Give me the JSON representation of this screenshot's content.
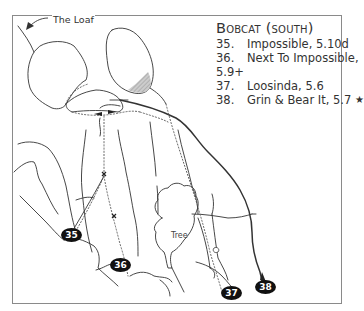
{
  "legend": {
    "title": "Bobcat (south)",
    "routes": [
      {
        "number": "35.",
        "name": "Impossible, 5.10d"
      },
      {
        "number": "36.",
        "name": "Next To Impossible,",
        "continuation": "5.9+"
      },
      {
        "number": "37.",
        "name": "Loosinda, 5.6"
      },
      {
        "number": "38.",
        "name": "Grin & Bear It, 5.7",
        "star": "★"
      }
    ]
  },
  "labels": {
    "loaf": "The Loaf",
    "tree": "Tree"
  },
  "badges": [
    "35",
    "36",
    "37",
    "38"
  ],
  "colors": {
    "line": "#333333",
    "frame": "#8a8a8a",
    "badge": "#111111",
    "shade": "#bbbbbb"
  }
}
